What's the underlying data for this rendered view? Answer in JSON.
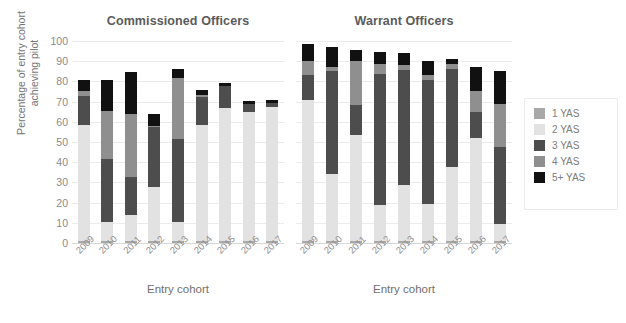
{
  "chart_data": {
    "type": "bar",
    "stacked": true,
    "title": "",
    "ylabel": "Percentage of entry cohort\nachieving pilot",
    "xlabel": "Entry cohort",
    "ylim": [
      0,
      100
    ],
    "yticks": [
      0,
      10,
      20,
      30,
      40,
      50,
      60,
      70,
      80,
      90,
      100
    ],
    "grid": true,
    "legend_position": "right",
    "series_names": [
      "1 YAS",
      "2 YAS",
      "3 YAS",
      "4 YAS",
      "5+ YAS"
    ],
    "series_colors": [
      "#a8a8a8",
      "#e2e2e2",
      "#4d4d4d",
      "#8f8f8f",
      "#111111"
    ],
    "categories": [
      "2009",
      "2010",
      "2011",
      "2012",
      "2013",
      "2014",
      "2015",
      "2016",
      "2017"
    ],
    "panels": [
      {
        "title": "Commissioned Officers",
        "xlabel": "Entry cohort",
        "categories": [
          "2009",
          "2010",
          "2011",
          "2012",
          "2013",
          "2014",
          "2015",
          "2016",
          "2017"
        ],
        "series": [
          {
            "name": "1 YAS",
            "values": [
              1.0,
              1.0,
              1.0,
              1.0,
              1.0,
              1.0,
              1.0,
              1.0,
              1.0
            ]
          },
          {
            "name": "2 YAS",
            "values": [
              57.5,
              9.5,
              13.0,
              26.5,
              9.5,
              57.5,
              66.0,
              64.0,
              66.5
            ]
          },
          {
            "name": "3 YAS",
            "values": [
              14.5,
              31.0,
              18.5,
              30.0,
              41.0,
              14.0,
              10.5,
              4.0,
              2.0
            ]
          },
          {
            "name": "4 YAS",
            "values": [
              2.5,
              24.0,
              31.5,
              0.5,
              30.0,
              1.0,
              0.0,
              0.0,
              0.0
            ]
          },
          {
            "name": "5+ YAS",
            "values": [
              5.0,
              15.0,
              20.5,
              6.0,
              4.5,
              2.5,
              1.5,
              1.5,
              1.5
            ]
          }
        ],
        "totals": [
          80.5,
          80.5,
          84.5,
          64.0,
          86.0,
          76.0,
          79.0,
          70.5,
          71.0
        ]
      },
      {
        "title": "Warrant Officers",
        "xlabel": "Entry cohort",
        "categories": [
          "2009",
          "2010",
          "2011",
          "2012",
          "2013",
          "2014",
          "2015",
          "2016",
          "2017"
        ],
        "series": [
          {
            "name": "1 YAS",
            "values": [
              1.0,
              1.0,
              1.0,
              1.0,
              1.0,
              1.0,
              1.0,
              1.0,
              1.0
            ]
          },
          {
            "name": "2 YAS",
            "values": [
              70.0,
              33.0,
              52.5,
              18.0,
              27.5,
              18.5,
              36.5,
              51.0,
              8.5
            ]
          },
          {
            "name": "3 YAS",
            "values": [
              12.0,
              51.0,
              15.0,
              64.5,
              57.0,
              61.0,
              48.5,
              13.0,
              38.0
            ]
          },
          {
            "name": "4 YAS",
            "values": [
              7.0,
              2.0,
              21.5,
              5.0,
              2.5,
              2.5,
              2.5,
              10.5,
              21.5
            ]
          },
          {
            "name": "5+ YAS",
            "values": [
              8.5,
              10.0,
              5.5,
              6.0,
              6.0,
              7.0,
              2.5,
              11.5,
              16.0
            ]
          }
        ],
        "totals": [
          98.5,
          97.0,
          95.5,
          94.5,
          94.0,
          90.0,
          91.0,
          87.0,
          85.0
        ]
      }
    ]
  },
  "legend": {
    "items": [
      {
        "label": "1 YAS",
        "color": "#a8a8a8"
      },
      {
        "label": "2 YAS",
        "color": "#e2e2e2"
      },
      {
        "label": "3 YAS",
        "color": "#4d4d4d"
      },
      {
        "label": "4 YAS",
        "color": "#8f8f8f"
      },
      {
        "label": "5+ YAS",
        "color": "#111111"
      }
    ]
  },
  "axes": {
    "ylabel": "Percentage of entry cohort\nachieving pilot",
    "yticks": [
      "100",
      "90",
      "80",
      "70",
      "60",
      "50",
      "40",
      "30",
      "20",
      "10",
      "0"
    ],
    "xlabel_left": "Entry cohort",
    "xlabel_right": "Entry cohort"
  }
}
